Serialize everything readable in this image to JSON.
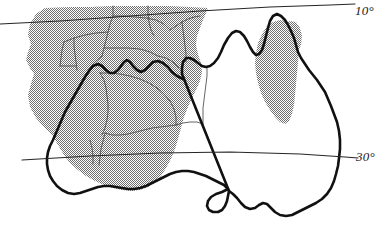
{
  "figure": {
    "name": "australia-distribution-map",
    "type": "map",
    "region": "Australia and southern Indonesia / New Guinea margin",
    "width": 388,
    "height": 229,
    "background_color": "#ffffff"
  },
  "graticule": {
    "label_style": "italic-with-leading-dash",
    "lines": [
      {
        "id": "lat-10",
        "label": "10°",
        "value": 10,
        "unit": "degrees",
        "label_x": 355,
        "label_y": 3,
        "path": "M 0,24 L 60,21 L 130,16 L 200,11 L 270,7 L 330,5 L 355,4",
        "color": "#262626",
        "width": 1.1
      },
      {
        "id": "lat-30",
        "label": "30°",
        "value": 30,
        "unit": "degrees",
        "label_x": 356,
        "label_y": 149,
        "path": "M 22,160 L 90,156 L 160,153 L 230,152 L 300,154 L 345,157 L 358,158",
        "color": "#262626",
        "width": 1.1
      }
    ]
  },
  "legend": {
    "shaded_region_meaning": "distribution area",
    "shade_color": "#9a9a9a",
    "shade_pattern": "50-percent-dither-checker"
  },
  "layers": {
    "shaded_distribution": {
      "name": "shaded-distribution-area",
      "fill": "#9d9d9d",
      "opacity": 1,
      "polygons": [
        {
          "id": "main-northwest-shade",
          "path": "M 45,8 L 36,14 L 30,24 L 28,35 L 31,44 L 28,52 L 26,60 L 30,68 L 34,74 L 31,84 L 28,95 L 30,107 L 36,118 L 44,127 L 52,135 L 58,145 L 64,155 L 70,163 L 78,170 L 86,176 L 95,181 L 104,185 L 113,188 L 122,190 L 131,191 L 140,190 L 148,187 L 155,182 L 161,176 L 166,168 L 171,159 L 175,149 L 178,139 L 181,128 L 184,117 L 188,107 L 192,98 L 196,90 L 200,81 L 202,72 L 201,63 L 198,54 L 196,45 L 197,36 L 200,28 L 203,20 L 206,13 L 208,8 L 190,7 L 170,6 L 150,6 L 130,6 L 110,6 L 90,7 L 70,7 Z"
        },
        {
          "id": "queensland-shade",
          "path": "M 267,26 L 262,34 L 258,43 L 256,53 L 255,63 L 256,73 L 258,83 L 261,93 L 265,102 L 270,110 L 275,117 L 280,122 L 285,124 L 289,121 L 292,114 L 294,105 L 295,95 L 296,84 L 297,73 L 298,62 L 299,51 L 298,41 L 295,32 L 291,25 L 286,21 L 280,20 L 273,22 Z"
        },
        {
          "id": "gulf-east-shade-lobe",
          "path": "M 284,24 L 290,21 L 296,22 L 300,28 L 302,36 L 301,45 L 298,52 L 294,56 L 290,54 L 287,46 L 285,36 Z"
        }
      ]
    },
    "coastline": {
      "name": "australia-coastline",
      "stroke": "#111111",
      "width": 2.6,
      "paths": [
        "M 183,79 L 177,76 L 172,72 L 168,67 L 163,63 L 158,61 L 153,62 L 149,66 L 145,70 L 141,72 L 137,70 L 133,66 L 130,62 L 127,60 L 124,62 L 121,66 L 118,70 L 114,73 L 110,73 L 106,70 L 102,66 L 98,64 L 93,66 L 89,71 L 85,77 L 81,84 L 77,91 L 73,98 L 69,105 L 65,112 L 62,119 L 59,126 L 56,133 L 53,140 L 50,146 L 48,152 L 47,158 L 47,164 L 48,170 L 50,176 L 53,181 L 57,186 L 62,190 L 68,193 L 74,194 L 80,193 L 86,191 L 92,189 L 98,187 L 104,186 L 110,186 L 116,187 L 122,188 L 128,189 L 134,189 L 140,188 L 146,186 L 152,183 L 158,180 L 164,177 L 170,174 L 176,172 L 182,171 L 188,171 L 194,172 L 200,174 L 206,176 L 212,179 L 218,182 L 224,185 L 228,189",
        "M 228,189 L 222,192 L 216,194 L 211,197 L 208,201 L 207,206 L 209,210 L 213,212 L 218,212 L 222,210 L 225,206 L 227,201 L 228,196 L 229,191",
        "M 229,191 L 233,194 L 237,198 L 241,203 L 245,207 L 250,209 L 255,208 L 259,205 L 263,203 L 267,204 L 271,208 L 275,212 L 280,215 L 286,216 L 292,215 L 298,212 L 304,209 L 310,206 L 316,203 L 322,199 L 327,194 L 331,188 L 334,181 L 336,174 L 338,166 L 339,158 L 340,149 L 340,140 L 339,131 L 337,122 L 334,114 L 331,106 L 328,99 L 325,92 L 321,86 L 317,80 L 313,75 L 309,70 L 305,64 L 301,58 L 298,52 L 296,45 L 294,38 L 291,31 L 288,25 L 285,20 L 281,16 L 277,14 L 273,16 L 270,21 L 268,28 L 266,36 L 264,44 L 262,50 L 259,54 L 256,55 L 253,52 L 250,47 L 247,41 L 244,36 L 240,32 L 236,31 L 232,33 L 228,38 L 224,45 L 221,52 L 218,58 L 214,63 L 210,66 L 206,67 L 202,66 L 198,63 L 194,60 L 190,58 L 186,58 L 183,62 L 182,68 L 182,74 Z"
      ]
    },
    "internal_boundaries": {
      "name": "administrative-boundary-lines",
      "stroke": "#4a4a4a",
      "width": 0.85,
      "paths": [
        "M 113,6 L 113,16 L 110,24 L 108,32 L 106,40 L 104,48 L 102,56",
        "M 113,16 L 124,16 L 135,17 L 146,18 L 156,20 L 164,24 L 170,30",
        "M 148,6 L 148,14 L 149,22 L 151,30 L 154,36",
        "M 170,30 L 176,26 L 182,22 L 188,19 L 194,17 L 200,16",
        "M 104,48 L 116,48 L 128,48 L 140,49 L 150,52 L 158,56",
        "M 108,32 L 96,33 L 85,35 L 74,38 L 64,42",
        "M 102,56 L 95,62 L 89,69 L 85,77",
        "M 158,56 L 166,58 L 173,62 L 179,68",
        "M 100,73 L 104,80 L 106,88 L 107,96 L 108,104 L 108,112 L 107,120 L 105,128 L 102,135",
        "M 100,73 L 110,73 L 120,74 L 130,76 L 140,79 L 149,83 L 157,88",
        "M 157,88 L 164,94 L 170,101 L 174,109 L 176,117 L 176,125",
        "M 176,125 L 168,126 L 160,127 L 152,128 L 144,130 L 136,132 L 128,134 L 120,135 L 112,135 L 105,133",
        "M 176,125 L 183,123 L 190,122 L 197,122 L 203,124",
        "M 203,124 L 203,116 L 203,108 L 204,100 L 205,92 L 206,84 L 207,76 L 207,68",
        "M 182,22 L 183,30 L 184,38 L 185,46 L 186,54 L 186,62",
        "M 64,42 L 62,50 L 61,58 L 60,66",
        "M 74,38 L 74,46 L 75,54 L 76,62 L 77,70",
        "M 90,140 L 92,148 L 93,156 L 93,164",
        "M 105,133 L 103,141 L 101,149 L 100,157 L 99,165",
        "M 60,66 L 68,66 L 76,66"
      ]
    }
  },
  "labels": {
    "lat_10": "10°",
    "lat_30": "30°"
  }
}
